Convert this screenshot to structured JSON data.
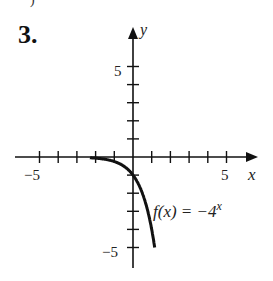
{
  "problem": {
    "number": "3.",
    "fragment": ")"
  },
  "chart_data": {
    "type": "line",
    "title": "",
    "function_label": "f(x) = −4",
    "function_exponent": "x",
    "xlabel": "x",
    "ylabel": "y",
    "xlim": [
      -6,
      6
    ],
    "ylim": [
      -6,
      6
    ],
    "x_ticks": [
      -5,
      -4,
      -3,
      -2,
      -1,
      1,
      2,
      3,
      4,
      5
    ],
    "y_ticks": [
      -5,
      -4,
      -3,
      -2,
      -1,
      1,
      2,
      3,
      4,
      5
    ],
    "x_tick_labels": {
      "-5": "−5",
      "5": "5"
    },
    "y_tick_labels": {
      "5": "5",
      "-5": "−5"
    },
    "grid": false,
    "series": [
      {
        "name": "f(x) = -4^x",
        "x": [
          -2,
          -1.5,
          -1,
          -0.5,
          0,
          0.5,
          1,
          1.16
        ],
        "y": [
          -0.0625,
          -0.125,
          -0.25,
          -0.5,
          -1,
          -2,
          -4,
          -5
        ]
      }
    ]
  }
}
